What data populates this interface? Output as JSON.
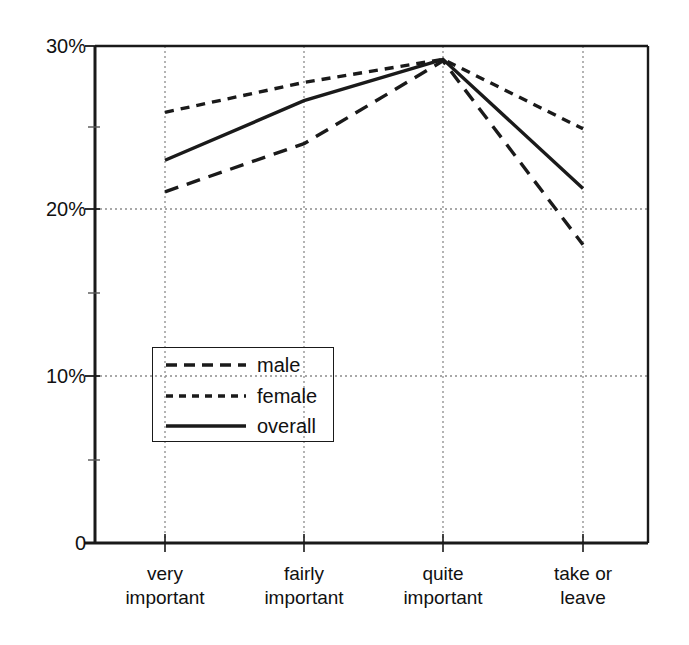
{
  "chart_data": {
    "type": "line",
    "title": "",
    "subtitle": "",
    "xlabel": "",
    "ylabel": "",
    "categories": [
      "very important",
      "fairly important",
      "quite important",
      "take or leave"
    ],
    "category_lines": [
      [
        "very",
        "important"
      ],
      [
        "fairly",
        "important"
      ],
      [
        "quite",
        "important"
      ],
      [
        "take or",
        "leave"
      ]
    ],
    "series": [
      {
        "name": "male",
        "style": "dashed",
        "values": [
          21.2,
          24.1,
          29.1,
          18.0
        ]
      },
      {
        "name": "female",
        "style": "dotted",
        "values": [
          26.0,
          27.8,
          29.2,
          25.0
        ]
      },
      {
        "name": "overall",
        "style": "solid",
        "values": [
          23.1,
          26.7,
          29.2,
          21.4
        ]
      }
    ],
    "ylim": [
      0,
      30
    ],
    "y_ticks": [
      0,
      10,
      20,
      30
    ],
    "y_tick_labels": [
      "0",
      "10%",
      "20%",
      "30%"
    ],
    "y_minor_ticks": [
      5,
      15,
      25
    ],
    "grid": true,
    "grid_style": "dotted",
    "legend_position": "lower-left-inside",
    "line_color": "#1a1a1a",
    "grid_color": "#8c8c8c",
    "axis_color": "#1a1a1a",
    "background_color": "#ffffff"
  },
  "legend": {
    "entries": [
      {
        "label": "male"
      },
      {
        "label": "female"
      },
      {
        "label": "overall"
      }
    ]
  },
  "axes": {
    "y_labels": [
      "30%",
      "20%",
      "10%",
      "0"
    ],
    "x_labels": [
      "very important",
      "fairly important",
      "quite important",
      "take or leave"
    ]
  }
}
